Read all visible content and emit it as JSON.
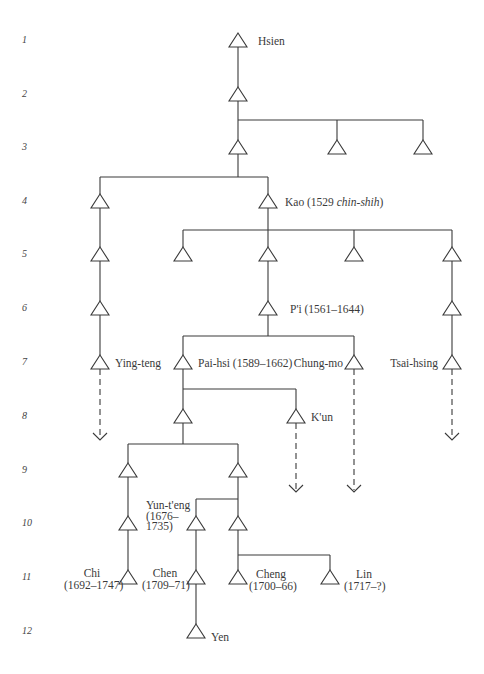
{
  "generations": [
    "1",
    "2",
    "3",
    "4",
    "5",
    "6",
    "7",
    "8",
    "9",
    "10",
    "11",
    "12"
  ],
  "people": {
    "hsien": {
      "name": "Hsien"
    },
    "kao": {
      "name": "Kao (1529 ",
      "note": "chin-shih",
      "close": ")"
    },
    "pi": {
      "name": "P'i (1561–1644)"
    },
    "ying_teng": {
      "name": "Ying-teng"
    },
    "pai_hsi": {
      "name": "Pai-hsi (1589–1662)"
    },
    "chung_mo": {
      "name": "Chung-mo"
    },
    "tsai_hsing": {
      "name": "Tsai-hsing"
    },
    "kun": {
      "name": "K'un"
    },
    "yun_teng": {
      "name": "Yun-t'eng",
      "dates_1": "(1676–",
      "dates_2": "1735)"
    },
    "chi": {
      "name": "Chi",
      "dates": "(1692–1747)"
    },
    "chen": {
      "name": "Chen",
      "dates": "(1709–71)"
    },
    "cheng": {
      "name": "Cheng",
      "dates": "(1700–66)"
    },
    "lin": {
      "name": "Lin",
      "dates": "(1717–?)"
    },
    "yen": {
      "name": "Yen"
    }
  },
  "colors": {
    "line": "#3a3a3a",
    "background": "#ffffff"
  }
}
